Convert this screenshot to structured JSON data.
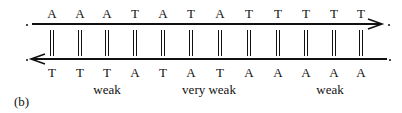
{
  "figure_label": "(b)",
  "top_strand": [
    "A",
    "A",
    "A",
    "T",
    "A",
    "T",
    "A",
    "T",
    "T",
    "T",
    "T",
    "T"
  ],
  "bottom_strand": [
    "T",
    "T",
    "T",
    "A",
    "T",
    "A",
    "T",
    "A",
    "A",
    "A",
    "A",
    "A"
  ],
  "region_labels": [
    {
      "text": "weak",
      "x": 107
    },
    {
      "text": "very weak",
      "x": 209
    },
    {
      "text": "weak",
      "x": 330
    }
  ],
  "positions_x": [
    52,
    80,
    107,
    135,
    163,
    191,
    220,
    249,
    278,
    306,
    334,
    361
  ],
  "colors": {
    "line": "#111111",
    "text": "#111111"
  }
}
